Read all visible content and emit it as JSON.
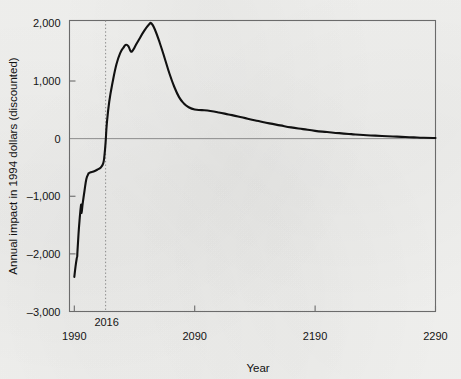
{
  "chart_data": {
    "type": "line",
    "title": "",
    "xlabel": "Year",
    "ylabel": "Annual impact in 1994 dollars (discounted)",
    "xlim": [
      1986,
      2290
    ],
    "ylim": [
      -3000,
      2050
    ],
    "grid": false,
    "legend": null,
    "x_ticks": [
      {
        "value": 1990,
        "label": "1990"
      },
      {
        "value": 2090,
        "label": "2090"
      },
      {
        "value": 2190,
        "label": "2190"
      },
      {
        "value": 2290,
        "label": "2290"
      }
    ],
    "y_ticks": [
      {
        "value": 2000,
        "label": "2,000"
      },
      {
        "value": 1000,
        "label": "1,000"
      },
      {
        "value": 0,
        "label": "0"
      },
      {
        "value": -1000,
        "label": "-1,000"
      },
      {
        "value": -2000,
        "label": "-2,000"
      },
      {
        "value": -3000,
        "label": "-3,000"
      }
    ],
    "annotations": [
      {
        "type": "vertical-dotted-line",
        "value": 2016,
        "label": "2016"
      }
    ],
    "reference_lines": [
      {
        "type": "horizontal",
        "value": 0
      }
    ],
    "series": [
      {
        "name": "Annual impact",
        "color": "#111111",
        "points": [
          [
            1990.0,
            -2400
          ],
          [
            1991.0,
            -2220
          ],
          [
            1992.0,
            -2080
          ],
          [
            1992.4,
            -2045
          ],
          [
            1992.6,
            -1960
          ],
          [
            1993.5,
            -1650
          ],
          [
            1994.5,
            -1380
          ],
          [
            1995.3,
            -1200
          ],
          [
            1995.8,
            -1150
          ],
          [
            1996.0,
            -1290
          ],
          [
            1997.0,
            -1120
          ],
          [
            1998.5,
            -900
          ],
          [
            2000.0,
            -700
          ],
          [
            2001.5,
            -620
          ],
          [
            2002.0,
            -600
          ],
          [
            2003.5,
            -585
          ],
          [
            2006.0,
            -570
          ],
          [
            2009.0,
            -540
          ],
          [
            2012.0,
            -500
          ],
          [
            2014.0,
            -430
          ],
          [
            2015.0,
            -300
          ],
          [
            2016.0,
            -60
          ],
          [
            2017.0,
            260
          ],
          [
            2019.0,
            640
          ],
          [
            2022.0,
            1000
          ],
          [
            2025.0,
            1290
          ],
          [
            2028.0,
            1480
          ],
          [
            2031.0,
            1585
          ],
          [
            2033.0,
            1630
          ],
          [
            2035.0,
            1600
          ],
          [
            2037.0,
            1510
          ],
          [
            2039.0,
            1545
          ],
          [
            2041.0,
            1620
          ],
          [
            2044.0,
            1730
          ],
          [
            2048.0,
            1870
          ],
          [
            2052.0,
            1980
          ],
          [
            2054.0,
            2000
          ],
          [
            2057.0,
            1890
          ],
          [
            2061.0,
            1660
          ],
          [
            2065.0,
            1400
          ],
          [
            2069.0,
            1130
          ],
          [
            2073.0,
            900
          ],
          [
            2077.0,
            720
          ],
          [
            2081.0,
            610
          ],
          [
            2085.0,
            545
          ],
          [
            2090.0,
            505
          ],
          [
            2096.0,
            495
          ],
          [
            2103.0,
            480
          ],
          [
            2110.0,
            455
          ],
          [
            2118.0,
            420
          ],
          [
            2126.0,
            385
          ],
          [
            2134.0,
            345
          ],
          [
            2143.0,
            305
          ],
          [
            2152.0,
            265
          ],
          [
            2161.0,
            230
          ],
          [
            2170.0,
            195
          ],
          [
            2180.0,
            165
          ],
          [
            2190.0,
            135
          ],
          [
            2200.0,
            115
          ],
          [
            2210.0,
            95
          ],
          [
            2220.0,
            78
          ],
          [
            2230.0,
            62
          ],
          [
            2240.0,
            52
          ],
          [
            2250.0,
            42
          ],
          [
            2258.0,
            35
          ],
          [
            2265.0,
            28
          ],
          [
            2272.0,
            22
          ],
          [
            2280.0,
            15
          ],
          [
            2290.0,
            10
          ]
        ]
      }
    ]
  }
}
